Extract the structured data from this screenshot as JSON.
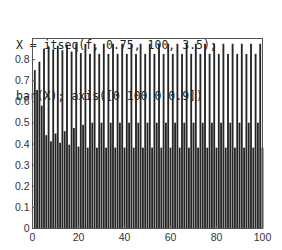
{
  "code": {
    "line1": "X = itseq(f, 0.75, 100, 3.5);",
    "line2": "bar(X); axis([0 100 0 0.9])"
  },
  "colors": {
    "bar": "#262626",
    "axis": "#555555",
    "background": "#ffffff"
  },
  "chart_data": {
    "type": "bar",
    "title": "",
    "xlabel": "",
    "ylabel": "",
    "xlim": [
      0,
      100
    ],
    "ylim": [
      0,
      0.9
    ],
    "grid": false,
    "legend": null,
    "xticks": [
      0,
      20,
      40,
      60,
      80,
      100
    ],
    "yticks": [
      0,
      0.1,
      0.2,
      0.3,
      0.4,
      0.5,
      0.6,
      0.7,
      0.8
    ],
    "ytick_labels": [
      "0",
      "0.1",
      "0.2",
      "0.3",
      "0.4",
      "0.5",
      "0.6",
      "0.7",
      "0.8"
    ],
    "xtick_labels": [
      "0",
      "20",
      "40",
      "60",
      "80",
      "100"
    ],
    "x": [
      1,
      2,
      3,
      4,
      5,
      6,
      7,
      8,
      9,
      10,
      11,
      12,
      13,
      14,
      15,
      16,
      17,
      18,
      19,
      20,
      21,
      22,
      23,
      24,
      25,
      26,
      27,
      28,
      29,
      30,
      31,
      32,
      33,
      34,
      35,
      36,
      37,
      38,
      39,
      40,
      41,
      42,
      43,
      44,
      45,
      46,
      47,
      48,
      49,
      50,
      51,
      52,
      53,
      54,
      55,
      56,
      57,
      58,
      59,
      60,
      61,
      62,
      63,
      64,
      65,
      66,
      67,
      68,
      69,
      70,
      71,
      72,
      73,
      74,
      75,
      76,
      77,
      78,
      79,
      80,
      81,
      82,
      83,
      84,
      85,
      86,
      87,
      88,
      89,
      90,
      91,
      92,
      93,
      94,
      95,
      96,
      97,
      98,
      99,
      100
    ],
    "values": [
      0.75,
      0.656,
      0.79,
      0.582,
      0.852,
      0.442,
      0.863,
      0.413,
      0.849,
      0.45,
      0.866,
      0.406,
      0.844,
      0.461,
      0.87,
      0.397,
      0.838,
      0.476,
      0.873,
      0.388,
      0.831,
      0.491,
      0.875,
      0.383,
      0.827,
      0.501,
      0.875,
      0.383,
      0.827,
      0.501,
      0.875,
      0.383,
      0.827,
      0.501,
      0.875,
      0.383,
      0.827,
      0.501,
      0.875,
      0.383,
      0.827,
      0.501,
      0.875,
      0.383,
      0.827,
      0.501,
      0.875,
      0.383,
      0.827,
      0.501,
      0.875,
      0.383,
      0.827,
      0.501,
      0.875,
      0.383,
      0.827,
      0.501,
      0.875,
      0.383,
      0.827,
      0.501,
      0.875,
      0.383,
      0.827,
      0.501,
      0.875,
      0.383,
      0.827,
      0.501,
      0.875,
      0.383,
      0.827,
      0.501,
      0.875,
      0.383,
      0.827,
      0.501,
      0.875,
      0.383,
      0.827,
      0.501,
      0.875,
      0.383,
      0.827,
      0.501,
      0.875,
      0.383,
      0.827,
      0.501,
      0.875,
      0.383,
      0.827,
      0.501,
      0.875,
      0.383,
      0.827,
      0.501,
      0.875,
      0.383
    ]
  }
}
